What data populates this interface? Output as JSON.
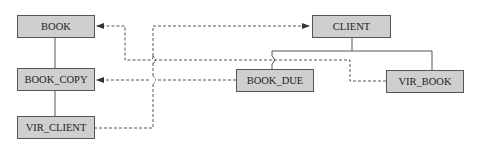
{
  "diagram": {
    "entities": [
      {
        "id": "book",
        "label": "BOOK"
      },
      {
        "id": "book_copy",
        "label": "BOOK_COPY"
      },
      {
        "id": "vir_client",
        "label": "VIR_CLIENT"
      },
      {
        "id": "client",
        "label": "CLIENT"
      },
      {
        "id": "book_due",
        "label": "BOOK_DUE"
      },
      {
        "id": "vir_book",
        "label": "VIR_BOOK"
      }
    ],
    "hierarchies": [
      {
        "parent": "BOOK",
        "children": [
          "BOOK_COPY"
        ],
        "style": "solid"
      },
      {
        "parent": "BOOK_COPY",
        "children": [
          "VIR_CLIENT"
        ],
        "style": "solid"
      },
      {
        "parent": "CLIENT",
        "children": [
          "BOOK_DUE",
          "VIR_BOOK"
        ],
        "style": "solid"
      }
    ],
    "references": [
      {
        "from": "VIR_BOOK",
        "to": "BOOK",
        "style": "dashed-arrow"
      },
      {
        "from": "BOOK_DUE",
        "to": "BOOK_COPY",
        "style": "dashed-arrow"
      },
      {
        "from": "VIR_CLIENT",
        "to": "CLIENT",
        "style": "dashed-arrow"
      }
    ],
    "colors": {
      "box_fill": "#cfcfcf",
      "box_border": "#555555",
      "line": "#555555"
    }
  }
}
